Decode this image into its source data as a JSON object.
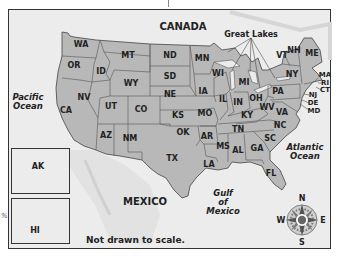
{
  "map": {
    "title_note": "Not drawn to scale.",
    "colors": {
      "land_us": "#b8b8b8",
      "land_other": "#ececec",
      "water": "#ececec",
      "border": "#444444",
      "compass_center": "#666666"
    },
    "regions": [
      {
        "name": "CANADA",
        "x": 183,
        "y": 26
      },
      {
        "name": "MEXICO",
        "x": 145,
        "y": 201
      }
    ],
    "water_bodies": [
      {
        "line1": "Pacific",
        "line2": "Ocean",
        "x": 28,
        "y": 102
      },
      {
        "line1": "Gulf",
        "line2": "of",
        "line3": "Mexico",
        "x": 223,
        "y": 202
      },
      {
        "line1": "Atlantic",
        "line2": "Ocean",
        "x": 305,
        "y": 152
      }
    ],
    "callout": {
      "label": "Great Lakes",
      "x": 251,
      "y": 34
    },
    "states": [
      {
        "abbr": "WA",
        "x": 81,
        "y": 45
      },
      {
        "abbr": "OR",
        "x": 74,
        "y": 66
      },
      {
        "abbr": "ID",
        "x": 101,
        "y": 72
      },
      {
        "abbr": "MT",
        "x": 128,
        "y": 56
      },
      {
        "abbr": "WY",
        "x": 131,
        "y": 84
      },
      {
        "abbr": "NV",
        "x": 84,
        "y": 98
      },
      {
        "abbr": "UT",
        "x": 111,
        "y": 107
      },
      {
        "abbr": "CO",
        "x": 141,
        "y": 110
      },
      {
        "abbr": "CA",
        "x": 66,
        "y": 111
      },
      {
        "abbr": "AZ",
        "x": 106,
        "y": 136
      },
      {
        "abbr": "NM",
        "x": 130,
        "y": 139
      },
      {
        "abbr": "ND",
        "x": 170,
        "y": 56
      },
      {
        "abbr": "SD",
        "x": 170,
        "y": 77
      },
      {
        "abbr": "NE",
        "x": 170,
        "y": 95
      },
      {
        "abbr": "KS",
        "x": 178,
        "y": 116
      },
      {
        "abbr": "OK",
        "x": 183,
        "y": 133
      },
      {
        "abbr": "TX",
        "x": 172,
        "y": 159
      },
      {
        "abbr": "MN",
        "x": 202,
        "y": 59
      },
      {
        "abbr": "IA",
        "x": 203,
        "y": 92
      },
      {
        "abbr": "MO",
        "x": 205,
        "y": 114
      },
      {
        "abbr": "AR",
        "x": 207,
        "y": 137
      },
      {
        "abbr": "LA",
        "x": 209,
        "y": 165
      },
      {
        "abbr": "WI",
        "x": 218,
        "y": 74
      },
      {
        "abbr": "IL",
        "x": 223,
        "y": 100
      },
      {
        "abbr": "MI",
        "x": 244,
        "y": 83
      },
      {
        "abbr": "IN",
        "x": 238,
        "y": 103
      },
      {
        "abbr": "OH",
        "x": 256,
        "y": 99
      },
      {
        "abbr": "KY",
        "x": 247,
        "y": 116
      },
      {
        "abbr": "TN",
        "x": 238,
        "y": 130
      },
      {
        "abbr": "MS",
        "x": 223,
        "y": 147
      },
      {
        "abbr": "AL",
        "x": 238,
        "y": 151
      },
      {
        "abbr": "GA",
        "x": 257,
        "y": 149
      },
      {
        "abbr": "FL",
        "x": 271,
        "y": 174
      },
      {
        "abbr": "SC",
        "x": 270,
        "y": 139
      },
      {
        "abbr": "NC",
        "x": 280,
        "y": 126
      },
      {
        "abbr": "VA",
        "x": 282,
        "y": 113
      },
      {
        "abbr": "WV",
        "x": 267,
        "y": 108
      },
      {
        "abbr": "PA",
        "x": 278,
        "y": 92
      },
      {
        "abbr": "NY",
        "x": 292,
        "y": 75
      },
      {
        "abbr": "VT",
        "x": 282,
        "y": 56
      },
      {
        "abbr": "NH",
        "x": 294,
        "y": 51
      },
      {
        "abbr": "ME",
        "x": 312,
        "y": 54
      },
      {
        "abbr": "MA",
        "x": 325,
        "y": 75,
        "small": true
      },
      {
        "abbr": "RI",
        "x": 325,
        "y": 83,
        "small": true
      },
      {
        "abbr": "CT",
        "x": 325,
        "y": 90,
        "small": true
      },
      {
        "abbr": "NJ",
        "x": 313,
        "y": 95,
        "small": true
      },
      {
        "abbr": "DE",
        "x": 313,
        "y": 103,
        "small": true
      },
      {
        "abbr": "MD",
        "x": 314,
        "y": 111,
        "small": true
      }
    ],
    "insets": [
      {
        "label": "AK",
        "x": 38,
        "y": 167
      },
      {
        "label": "HI",
        "x": 35,
        "y": 231
      }
    ],
    "compass": {
      "N": "N",
      "S": "S",
      "E": "E",
      "W": "W"
    },
    "edge_mark": "%"
  }
}
